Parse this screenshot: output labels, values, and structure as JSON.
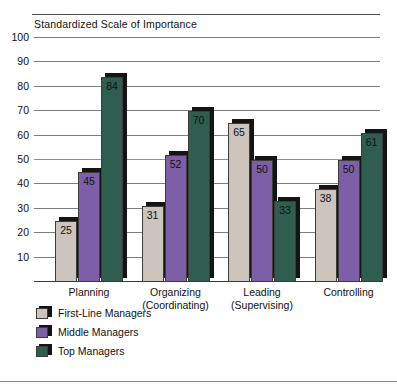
{
  "chart_data": {
    "type": "bar",
    "title": "Standardized Scale of Importance",
    "xlabel": "",
    "ylabel": "",
    "ylim": [
      0,
      100
    ],
    "yticks": [
      100,
      90,
      80,
      70,
      60,
      50,
      40,
      30,
      20,
      10
    ],
    "grid": true,
    "legend_position": "below-left",
    "orientation": "vertical-grouped",
    "categories": [
      "Planning",
      "Organizing",
      "Leading",
      "Controlling"
    ],
    "category_sublabels": [
      "",
      "(Coordinating)",
      "(Supervising)",
      ""
    ],
    "series": [
      {
        "name": "First-Line Managers",
        "color": "#cdc4bd",
        "values": [
          25,
          31,
          65,
          38
        ]
      },
      {
        "name": "Middle Managers",
        "color": "#7d5fa8",
        "values": [
          45,
          52,
          50,
          50
        ]
      },
      {
        "name": "Top Managers",
        "color": "#2f5d4f",
        "values": [
          84,
          70,
          33,
          61
        ]
      }
    ]
  },
  "colors": {
    "shadow": "#141414",
    "gridline": "#7d7d7d",
    "axis": "#3a3a3a",
    "text": "#111111",
    "background": "#ffffff"
  }
}
